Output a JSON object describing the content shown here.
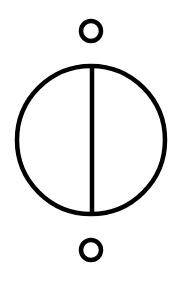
{
  "diagram": {
    "symbol": "current-source",
    "description": "Schematic symbol: circle with vertical line between two terminal rings",
    "colors": {
      "stroke": "#000000",
      "background": "#ffffff"
    },
    "terminals": [
      {
        "name": "top-terminal",
        "cx": 91,
        "cy": 31,
        "r": 10
      },
      {
        "name": "bottom-terminal",
        "cx": 91,
        "cy": 250,
        "r": 10
      }
    ],
    "body": {
      "cx": 91,
      "cy": 140,
      "r": 74
    },
    "divider": {
      "x": 92,
      "y1": 66,
      "y2": 214
    },
    "stroke_width": 4.5
  }
}
